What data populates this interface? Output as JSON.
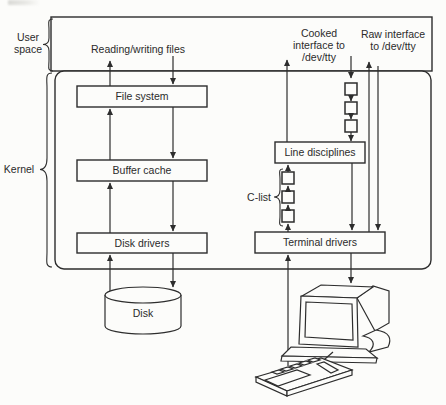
{
  "regions": {
    "user_space_line1": "User",
    "user_space_line2": "space",
    "kernel": "Kernel"
  },
  "annotations": {
    "reading_writing_files": "Reading/writing files",
    "cooked_line1": "Cooked",
    "cooked_line2": "interface to",
    "cooked_line3": "/dev/tty",
    "raw_line1": "Raw interface",
    "raw_line2": "to /dev/tty",
    "c_list": "C-list"
  },
  "boxes": {
    "file_system": "File system",
    "buffer_cache": "Buffer cache",
    "disk_drivers": "Disk drivers",
    "line_disciplines": "Line disciplines",
    "terminal_drivers": "Terminal drivers"
  },
  "storage": {
    "disk": "Disk"
  },
  "colors": {
    "ink": "#2d2d2d",
    "paper": "#fcfcfa"
  }
}
